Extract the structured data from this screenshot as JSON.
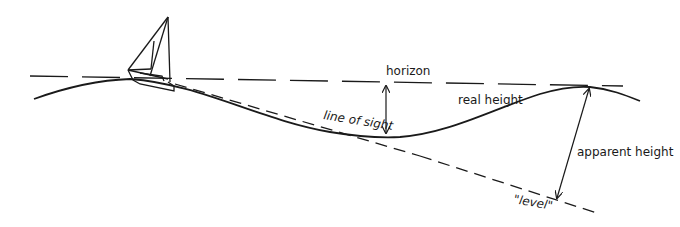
{
  "diagram": {
    "labels": {
      "horizon": "horizon",
      "real_height": "real height",
      "line_of_sight": "line of sight",
      "apparent_height": "apparent height",
      "level": "\"level\""
    },
    "elements": [
      "sailboat",
      "wave-surface",
      "horizon-line",
      "line-of-sight",
      "level-line",
      "real-height-arrow",
      "apparent-height-arrow"
    ],
    "colors": {
      "stroke": "#1a1a1a",
      "background": "#ffffff"
    }
  }
}
